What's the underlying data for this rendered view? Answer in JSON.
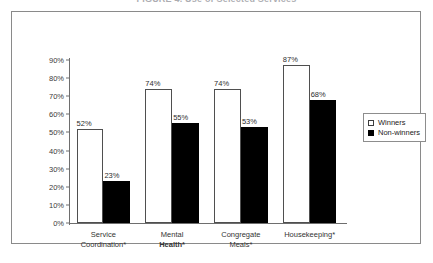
{
  "figure": {
    "caption": "FIGURE 4. Use of Selected Services",
    "caption_clipped": true
  },
  "legend": {
    "position": "top-right-inside",
    "entries": [
      {
        "label": "Winners",
        "swatch": "open-square",
        "color": "#ffffff"
      },
      {
        "label": "Non-winners",
        "swatch": "filled-square",
        "color": "#000000"
      }
    ]
  },
  "axis": {
    "y_ticks": [
      "0%",
      "10%",
      "20%",
      "30%",
      "40%",
      "50%",
      "60%",
      "70%",
      "80%",
      "90%"
    ]
  },
  "chart_data": {
    "type": "bar",
    "title": "FIGURE 4. Use of Selected Services",
    "xlabel": "",
    "ylabel": "",
    "ylim": [
      0,
      90
    ],
    "ytick_step": 10,
    "ytick_suffix": "%",
    "grid": false,
    "legend_position": "top right inside plot",
    "categories": [
      "Service\nCoordination*",
      "Mental\nHealth*",
      "Congregate\nMeals*",
      "Housekeeping*"
    ],
    "series": [
      {
        "name": "Winners",
        "values": [
          52,
          74,
          74,
          87
        ],
        "labels": [
          "52%",
          "74%",
          "74%",
          "87%"
        ]
      },
      {
        "name": "Non-winners",
        "values": [
          23,
          55,
          53,
          68
        ],
        "labels": [
          "23%",
          "55%",
          "53%",
          "68%"
        ]
      }
    ]
  }
}
